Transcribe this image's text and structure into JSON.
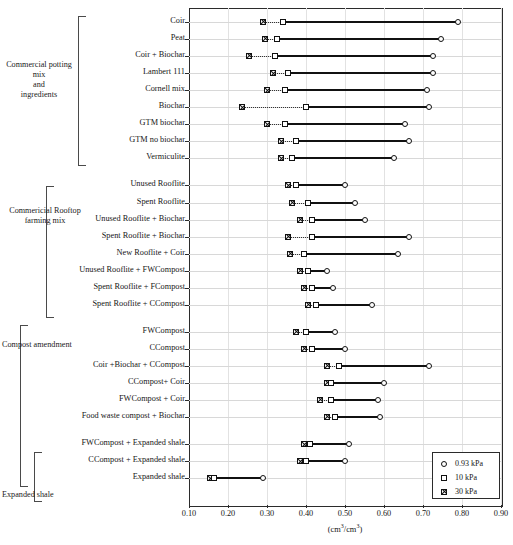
{
  "figure": {
    "x_axis_title": "(cm³/cm³)",
    "x_axis_title_html": "(cm3/cm3)",
    "xlim": [
      0.1,
      0.9
    ],
    "xticks": [
      "0.10",
      "0.20",
      "0.30",
      "0.40",
      "0.50",
      "0.60",
      "0.70",
      "0.80",
      "0.90"
    ]
  },
  "groups": [
    {
      "label": "Commercial potting\nmix\nand\ningredients",
      "first_row": 0,
      "last_row": 8
    },
    {
      "label": "Commericial Rooftop\nfarming mix",
      "first_row": 9,
      "last_row": 16
    },
    {
      "label": "Compost amendment",
      "first_row": 17,
      "last_row": 25
    },
    {
      "label": "Expanded shale",
      "first_row": 23,
      "last_row": 25
    }
  ],
  "legend": {
    "items": [
      {
        "symbol": "circle",
        "label": "0.93 kPa"
      },
      {
        "symbol": "square",
        "label": "10 kPa"
      },
      {
        "symbol": "xsquare",
        "label": "30 kPa"
      }
    ]
  },
  "chart_data": {
    "type": "line",
    "title": "",
    "xlabel": "(cm³/cm³)",
    "ylabel": "",
    "xlim": [
      0.1,
      0.9
    ],
    "grid": true,
    "legend_position": "bottom-right",
    "series": [
      {
        "name": "0.93 kPa",
        "symbol": "circle"
      },
      {
        "name": "10 kPa",
        "symbol": "square"
      },
      {
        "name": "30 kPa",
        "symbol": "xsquare"
      }
    ],
    "categories": [
      "Coir",
      "Peat",
      "Coir + Biochar",
      "Lambert 111",
      "Cornell mix",
      "Biochar",
      "GTM biochar",
      "GTM no biochar",
      "Vermiculite",
      "Unused Rooflite",
      "Spent Rooflite",
      "Unused Rooflite + Biochar",
      "Spent Rooflite + Biochar",
      "New Rooflite + Coir",
      "Unused Rooflite + FWCompost",
      "Spent Rooflite + FCompost",
      "Spent Rooflite + CCompost",
      "FWCompost",
      "CCompost",
      "Coir +Biochar + CCompost",
      "CCompost+ Coir",
      "FWCompost + Coir",
      "Food waste compost + Biochar",
      "FWCompost + Expanded shale",
      "CCompost + Expanded shale",
      "Expanded shale"
    ],
    "rows": [
      {
        "category": "Coir",
        "v30": 0.29,
        "v10": 0.34,
        "v093": 0.79
      },
      {
        "category": "Peat",
        "v30": 0.295,
        "v10": 0.325,
        "v093": 0.745
      },
      {
        "category": "Coir + Biochar",
        "v30": 0.255,
        "v10": 0.32,
        "v093": 0.725
      },
      {
        "category": "Lambert 111",
        "v30": 0.315,
        "v10": 0.355,
        "v093": 0.725
      },
      {
        "category": "Cornell mix",
        "v30": 0.3,
        "v10": 0.345,
        "v093": 0.71
      },
      {
        "category": "Biochar",
        "v30": 0.235,
        "v10": 0.4,
        "v093": 0.715
      },
      {
        "category": "GTM biochar",
        "v30": 0.3,
        "v10": 0.345,
        "v093": 0.655
      },
      {
        "category": "GTM no biochar",
        "v30": 0.335,
        "v10": 0.375,
        "v093": 0.665
      },
      {
        "category": "Vermiculite",
        "v30": 0.335,
        "v10": 0.365,
        "v093": 0.625
      },
      {
        "category": "Unused Rooflite",
        "v30": 0.355,
        "v10": 0.375,
        "v093": 0.5
      },
      {
        "category": "Spent Rooflite",
        "v30": 0.365,
        "v10": 0.405,
        "v093": 0.525
      },
      {
        "category": "Unused Rooflite + Biochar",
        "v30": 0.385,
        "v10": 0.415,
        "v093": 0.55
      },
      {
        "category": "Spent Rooflite + Biochar",
        "v30": 0.355,
        "v10": 0.415,
        "v093": 0.665
      },
      {
        "category": "New Rooflite + Coir",
        "v30": 0.36,
        "v10": 0.395,
        "v093": 0.635
      },
      {
        "category": "Unused Rooflite + FWCompost",
        "v30": 0.385,
        "v10": 0.405,
        "v093": 0.455
      },
      {
        "category": "Spent Rooflite + FCompost",
        "v30": 0.395,
        "v10": 0.415,
        "v093": 0.47
      },
      {
        "category": "Spent Rooflite + CCompost",
        "v30": 0.405,
        "v10": 0.425,
        "v093": 0.57
      },
      {
        "category": "FWCompost",
        "v30": 0.375,
        "v10": 0.4,
        "v093": 0.475
      },
      {
        "category": "CCompost",
        "v30": 0.395,
        "v10": 0.415,
        "v093": 0.5
      },
      {
        "category": "Coir +Biochar + CCompost",
        "v30": 0.455,
        "v10": 0.485,
        "v093": 0.715
      },
      {
        "category": "CCompost+ Coir",
        "v30": 0.455,
        "v10": 0.465,
        "v093": 0.6
      },
      {
        "category": "FWCompost + Coir",
        "v30": 0.435,
        "v10": 0.465,
        "v093": 0.585
      },
      {
        "category": "Food waste compost + Biochar",
        "v30": 0.455,
        "v10": 0.475,
        "v093": 0.59
      },
      {
        "category": "FWCompost + Expanded shale",
        "v30": 0.395,
        "v10": 0.41,
        "v093": 0.51
      },
      {
        "category": "CCompost + Expanded shale",
        "v30": 0.385,
        "v10": 0.4,
        "v093": 0.5
      },
      {
        "category": "Expanded shale",
        "v30": 0.155,
        "v10": 0.165,
        "v093": 0.29
      }
    ]
  }
}
